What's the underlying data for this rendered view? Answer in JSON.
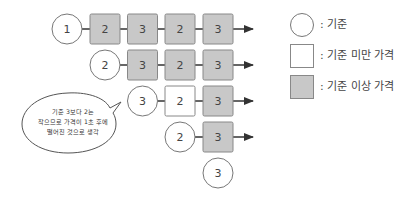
{
  "colors": {
    "stroke": "#555555",
    "gray_fill": "#c8c8c8",
    "white_fill": "#ffffff",
    "arrow": "#333333"
  },
  "rows": [
    {
      "start": {
        "label": "1",
        "col": 0
      },
      "cells": [
        {
          "label": "2",
          "type": "gte"
        },
        {
          "label": "3",
          "type": "gte"
        },
        {
          "label": "2",
          "type": "gte"
        },
        {
          "label": "3",
          "type": "gte"
        }
      ]
    },
    {
      "start": {
        "label": "2",
        "col": 1
      },
      "cells": [
        {
          "label": "3",
          "type": "gte"
        },
        {
          "label": "2",
          "type": "gte"
        },
        {
          "label": "3",
          "type": "gte"
        }
      ]
    },
    {
      "start": {
        "label": "3",
        "col": 2
      },
      "cells": [
        {
          "label": "2",
          "type": "lt"
        },
        {
          "label": "3",
          "type": "gte"
        }
      ]
    },
    {
      "start": {
        "label": "2",
        "col": 3
      },
      "cells": [
        {
          "label": "3",
          "type": "gte"
        }
      ]
    },
    {
      "start": {
        "label": "3",
        "col": 4
      },
      "cells": []
    }
  ],
  "speech_bubble": {
    "lines": [
      "기준 3보다 2는",
      "작으므로 가격이 1초 후에",
      "떨어진 것으로 생각"
    ]
  },
  "legend": [
    {
      "shape": "circle",
      "label": ": 기준"
    },
    {
      "shape": "white-square",
      "label": ": 기준 미만 가격"
    },
    {
      "shape": "gray-square",
      "label": ": 기준 이상 가격"
    }
  ]
}
